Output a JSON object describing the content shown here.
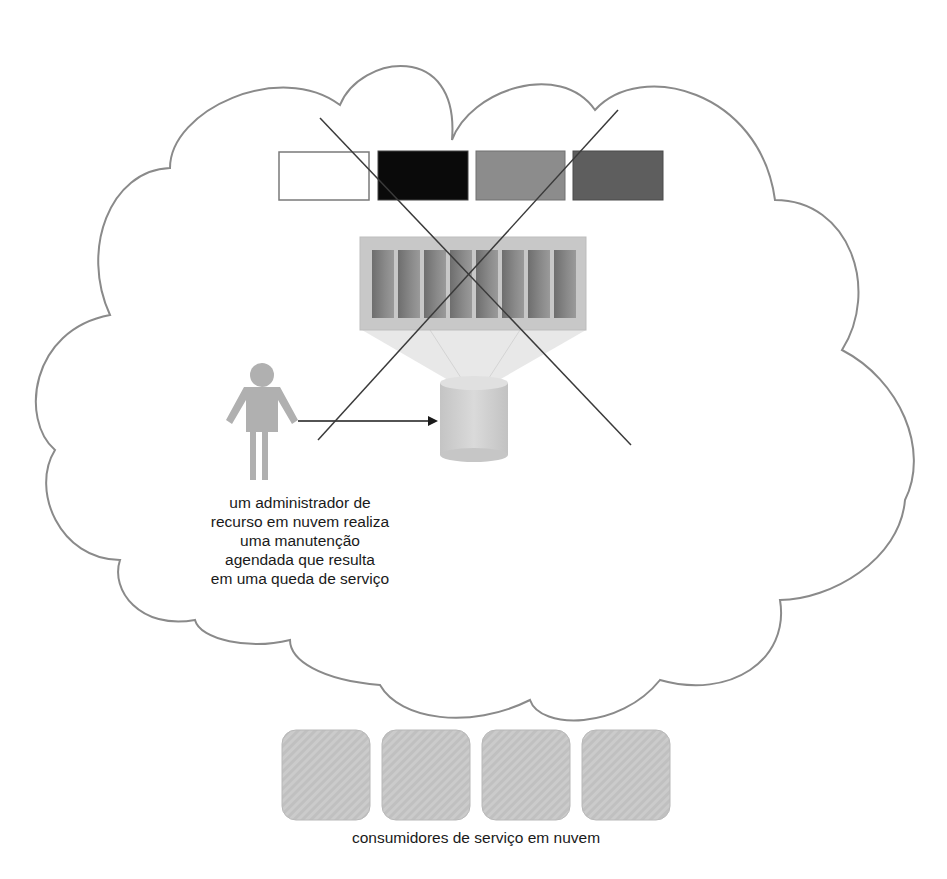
{
  "diagram": {
    "admin_caption_lines": [
      "um administrador de",
      "recurso em nuvem realiza",
      "uma manutenção",
      "agendada que resulta",
      "em uma queda de serviço"
    ],
    "consumers_caption": "consumidores de serviço em nuvem",
    "colors": {
      "cloud_outline": "#8a8a8a",
      "box_white": "#ffffff",
      "box_black": "#0a0a0a",
      "box_gray": "#8c8c8c",
      "box_dark_gray": "#5e5e5e",
      "server_tray": "#c8c8c8",
      "server_blade": "#7d7d7d",
      "consumer_box": "#c9c9c9",
      "person": "#b0b0b0",
      "x_mark": "#3a3a3a"
    },
    "resource_boxes": [
      "white",
      "black",
      "gray",
      "dark-gray"
    ],
    "server_blade_count": 8,
    "consumer_count": 4
  }
}
